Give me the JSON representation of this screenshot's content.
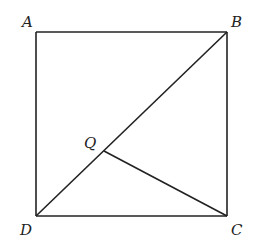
{
  "diagram": {
    "type": "geometry",
    "points": {
      "A": {
        "label": "A",
        "x": 36,
        "y": 32
      },
      "B": {
        "label": "B",
        "x": 227,
        "y": 32
      },
      "C": {
        "label": "C",
        "x": 227,
        "y": 216
      },
      "D": {
        "label": "D",
        "x": 36,
        "y": 216
      },
      "Q": {
        "label": "Q",
        "x": 104,
        "y": 151
      }
    },
    "segments": [
      "AB",
      "BC",
      "CD",
      "DA",
      "BD",
      "QC"
    ],
    "colors": {
      "stroke": "#222222",
      "background": "#ffffff"
    }
  }
}
